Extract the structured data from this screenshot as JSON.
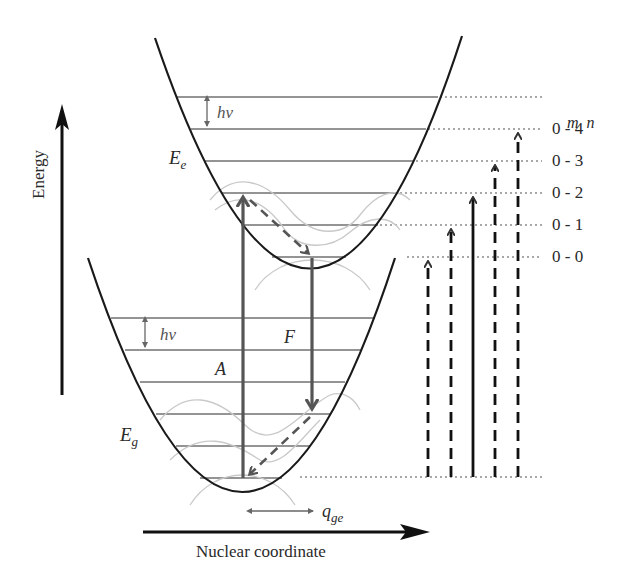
{
  "diagram": {
    "type": "Franck-Condon energy level diagram",
    "axes": {
      "y_label": "Energy",
      "x_label": "Nuclear coordinate"
    },
    "states": {
      "excited": {
        "label_main": "E",
        "label_sub": "e",
        "level_spacing_label": "hν",
        "levels": 6
      },
      "ground": {
        "label_main": "E",
        "label_sub": "g",
        "level_spacing_label": "hν",
        "levels": 6
      }
    },
    "transitions": {
      "absorption_label": "A",
      "fluorescence_label": "F"
    },
    "displacement": {
      "label_main": "q",
      "label_sub": "ge"
    },
    "vibronic_labels": {
      "header": "m  n",
      "items": [
        "0 - 4",
        "0 - 3",
        "0 - 2",
        "0 - 1",
        "0 - 0"
      ]
    },
    "colors": {
      "curve": "#1a1a1a",
      "level": "#6a6a6a",
      "arrow": "#4a4a4a",
      "wave": "#c8c8c8",
      "dotted": "#8a8a8a"
    }
  }
}
